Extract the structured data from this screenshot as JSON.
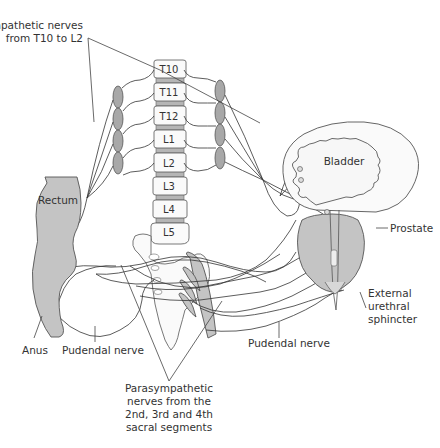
{
  "diagram": {
    "labels": {
      "sympathetic_line1": "Sympathetic nerves",
      "sympathetic_line2": "from T10 to L2",
      "rectum": "Rectum",
      "bladder": "Bladder",
      "prostate": "Prostate",
      "external_line1": "External",
      "external_line2": "urethral",
      "external_line3": "sphincter",
      "anus": "Anus",
      "pudendal_left": "Pudendal nerve",
      "pudendal_right": "Pudendal nerve",
      "parasym_line1": "Parasympathetic",
      "parasym_line2": "nerves from the",
      "parasym_line3": "2nd, 3rd and 4th",
      "parasym_line4": "sacral segments"
    },
    "vertebrae": [
      "T10",
      "T11",
      "T12",
      "L1",
      "L2",
      "L3",
      "L4",
      "L5"
    ],
    "colors": {
      "organ_fill": "#c4c4c4",
      "ganglion_fill": "#a8a8a8",
      "line": "#333333",
      "background": "#ffffff"
    }
  }
}
